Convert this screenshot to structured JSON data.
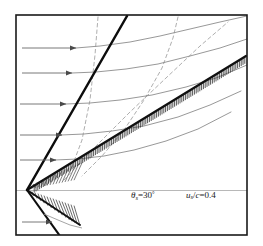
{
  "figure": {
    "frame": {
      "x": 15,
      "y": 14,
      "width": 233,
      "height": 222,
      "border_color": "#1a1a1a",
      "background": "#ffffff"
    },
    "labels": [
      {
        "id": "shock-angle",
        "symbol": "θ",
        "subscript": "s",
        "equals": "=",
        "value": "30",
        "unit": "°",
        "text": "θs=30°",
        "x": 131,
        "y": 190
      },
      {
        "id": "velocity-ratio",
        "symbol": "u",
        "subscript": "s",
        "divider": "/c",
        "equals": "=",
        "value": "0.4",
        "text": "us/c=0.4",
        "x": 186,
        "y": 190
      }
    ],
    "apex": {
      "x": 27,
      "y": 190
    },
    "colors": {
      "frame": "#1a1a1a",
      "shock": "#111111",
      "wall": "#111111",
      "streamline": "#8a8a8a",
      "characteristic": "#9a9a9a",
      "axis": "#b0b0b0",
      "hatch": "#222222",
      "text": "#1a1a1a"
    },
    "inflow_arrows": [
      {
        "y": 48,
        "x_start": 22,
        "x_end": 76
      },
      {
        "y": 73,
        "x_start": 22,
        "x_end": 72
      },
      {
        "y": 104,
        "x_start": 20,
        "x_end": 66
      },
      {
        "y": 135,
        "x_start": 20,
        "x_end": 62
      },
      {
        "y": 160,
        "x_start": 20,
        "x_end": 56
      },
      {
        "y": 222,
        "x_start": 22,
        "x_end": 52
      }
    ],
    "shock_line": {
      "x1": 27,
      "y1": 190,
      "x2": 127,
      "y2": 17,
      "width": 2.4
    },
    "wall_line": {
      "x1": 27,
      "y1": 190,
      "x2": 243,
      "y2": 57,
      "width": 2.2
    },
    "lower_wall_line": {
      "x1": 27,
      "y1": 190,
      "x2": 72,
      "y2": 211,
      "width": 1.8
    },
    "lower_shock_line": {
      "x1": 27,
      "y1": 190,
      "x2": 58,
      "y2": 236,
      "width": 2.0
    },
    "horizontal_axis": {
      "y": 190,
      "x_start": 16,
      "x_end": 247
    },
    "streamlines": [
      {
        "id": "streamline-1",
        "points": "76,48 100,46 130,42 160,36 190,29 220,22 247,17"
      },
      {
        "id": "streamline-2",
        "points": "72,73 96,72 126,69 158,64 190,56 220,48 247,40"
      },
      {
        "id": "streamline-3",
        "points": "66,104 90,103 120,100 152,95 186,87 216,78 247,66"
      },
      {
        "id": "streamline-4",
        "points": "62,135 84,134 112,131 144,126 178,117 210,105 240,92"
      },
      {
        "id": "streamline-5",
        "points": "56,160 78,159 104,156 134,150 166,141 198,129 230,113"
      }
    ],
    "characteristics": [
      {
        "id": "char-vertical-1",
        "points": "98,17 94,60 88,110 78,150 66,178"
      },
      {
        "id": "char-vertical-2",
        "points": "178,17 172,40 160,70 142,104 122,135 100,160 80,178"
      },
      {
        "id": "char-diagonal",
        "points": "66,178 96,146 130,112 166,78 200,46 228,22"
      }
    ],
    "lower_curve": {
      "points": "46,215 60,221 72,226 84,229"
    },
    "hatching": {
      "upper_wall": {
        "count": 120,
        "length": 7,
        "description": "tick hatching below upper wedge surface"
      },
      "lower_wedge": {
        "description": "dense hatched wedge below horizontal axis near apex"
      },
      "apex_fan": {
        "description": "fine hatched fan above horizontal axis at apex"
      }
    }
  }
}
